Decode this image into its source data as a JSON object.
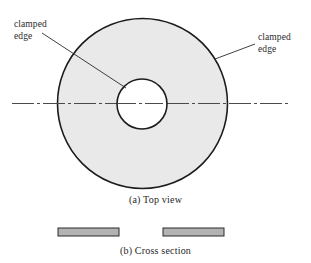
{
  "figure": {
    "name": "annular-clamped-plate-figure",
    "background_color": "#ffffff",
    "width": 311,
    "height": 263
  },
  "labels": {
    "clamped_edge_left": {
      "line1": "clamped",
      "line2": "edge"
    },
    "clamped_edge_right": {
      "line1": "clamped",
      "line2": "edge"
    }
  },
  "captions": {
    "top_view": "(a) Top view",
    "cross_section": "(b) Cross section"
  },
  "geometry": {
    "outer_circle": {
      "cx": 142.5,
      "cy": 103.5,
      "r": 85,
      "fill": "#e9e9e9",
      "stroke": "#1c1c1c",
      "stroke_width": 1.6
    },
    "inner_circle": {
      "cx": 142,
      "cy": 104,
      "r": 25,
      "fill": "#ffffff",
      "stroke": "#1c1c1c",
      "stroke_width": 1.6
    },
    "centerline": {
      "x1": 12,
      "x2": 289,
      "y": 103.5,
      "stroke": "#4a4a4a",
      "stroke_width": 1,
      "dash_pattern": "22 3 3 3"
    },
    "leader_left": {
      "x1": 42,
      "y1": 33,
      "x2": 126,
      "y2": 88,
      "stroke": "#2a2a2a",
      "stroke_width": 0.9
    },
    "leader_right": {
      "x1": 255,
      "y1": 44,
      "x2": 215,
      "y2": 59,
      "stroke": "#2a2a2a",
      "stroke_width": 0.9
    },
    "cross_section_bars": [
      {
        "name": "cross-section-bar-left",
        "x": 58,
        "y": 228,
        "width": 61,
        "height": 8,
        "fill": "#b3b3b3",
        "stroke": "#2a2a2a",
        "stroke_width": 1
      },
      {
        "name": "cross-section-bar-right",
        "x": 163,
        "y": 228,
        "width": 61,
        "height": 8,
        "fill": "#b3b3b3",
        "stroke": "#2a2a2a",
        "stroke_width": 1
      }
    ]
  },
  "colors": {
    "plate_fill": "#e9e9e9",
    "hole_fill": "#ffffff",
    "outline": "#1c1c1c",
    "bar_fill": "#b3b3b3",
    "centerline": "#4a4a4a",
    "text": "#1f1f1f"
  }
}
